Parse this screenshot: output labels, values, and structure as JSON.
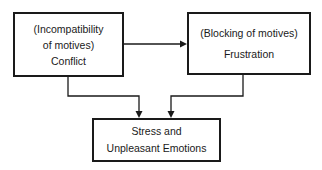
{
  "diagram": {
    "nodes": [
      {
        "id": "conflict",
        "subtitle": "(Incompatibility",
        "subtitle2": "of motives)",
        "title": "Conflict"
      },
      {
        "id": "frustration",
        "subtitle": "(Blocking of motives)",
        "title": "Frustration"
      },
      {
        "id": "stress",
        "line1": "Stress and",
        "line2": "Unpleasant Emotions"
      }
    ],
    "edges": [
      {
        "from": "conflict",
        "to": "frustration"
      },
      {
        "from": "conflict",
        "to": "stress"
      },
      {
        "from": "frustration",
        "to": "stress"
      }
    ],
    "colors": {
      "stroke": "#1a1a1a",
      "background": "#ffffff"
    }
  }
}
